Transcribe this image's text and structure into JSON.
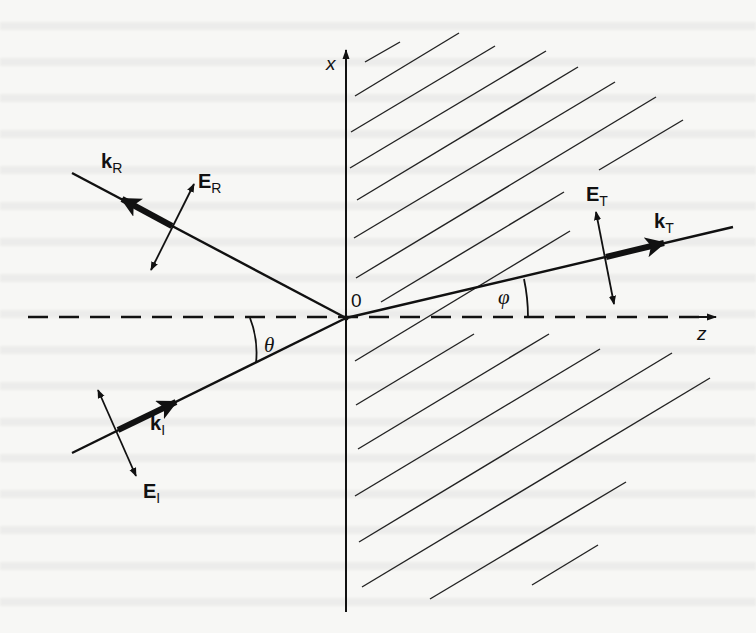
{
  "figure": {
    "axes": {
      "vertical_label": "x",
      "horizontal_label": "z",
      "origin_label": "0"
    },
    "angles": {
      "incidence": "θ",
      "transmission": "φ"
    },
    "vectors": {
      "incident_wave": {
        "k": "k",
        "k_sub": "I",
        "E": "E",
        "E_sub": "I"
      },
      "reflected_wave": {
        "k": "k",
        "k_sub": "R",
        "E": "E",
        "E_sub": "R"
      },
      "transmitted_wave": {
        "k": "k",
        "k_sub": "T",
        "E": "E",
        "E_sub": "T"
      }
    },
    "regions": {
      "left_medium": "unshaded",
      "right_medium": "hatched"
    },
    "colors": {
      "ink": "#111111",
      "paper": "#f7f7f5"
    }
  }
}
